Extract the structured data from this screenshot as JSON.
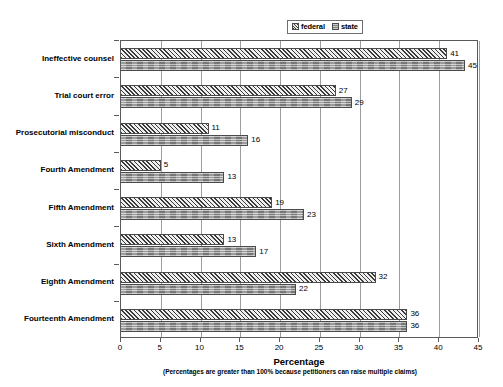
{
  "chart_data": {
    "type": "bar",
    "orientation": "horizontal",
    "title": "",
    "xlabel": "Percentage",
    "ylabel": "",
    "note": "(Percentages are greater than 100% because petitioners can raise multiple claims)",
    "xlim": [
      0,
      45
    ],
    "xticks": [
      0,
      5,
      10,
      15,
      20,
      25,
      30,
      35,
      40,
      45
    ],
    "grid": true,
    "legend_position": "top-right",
    "categories": [
      "Ineffective counsel",
      "Trial court error",
      "Prosecutorial misconduct",
      "Fourth Amendment",
      "Fifth Amendment",
      "Sixth Amendment",
      "Eighth Amendment",
      "Fourteenth Amendment"
    ],
    "series": [
      {
        "name": "federal",
        "values": [
          41,
          27,
          11,
          5,
          19,
          13,
          32,
          36
        ]
      },
      {
        "name": "state",
        "values": [
          45,
          29,
          16,
          13,
          23,
          17,
          22,
          36
        ]
      }
    ],
    "colors": {
      "federal": "#a6a6a6",
      "state": "#8f8f8f",
      "axis": "#5a5a5a",
      "grid": "#9d9d9d",
      "text": "#000000"
    }
  },
  "legend": {
    "entries": [
      {
        "label": "federal",
        "swatch": "hatch-diagonal-swatch"
      },
      {
        "label": "state",
        "swatch": "solid-gray-swatch"
      }
    ]
  }
}
